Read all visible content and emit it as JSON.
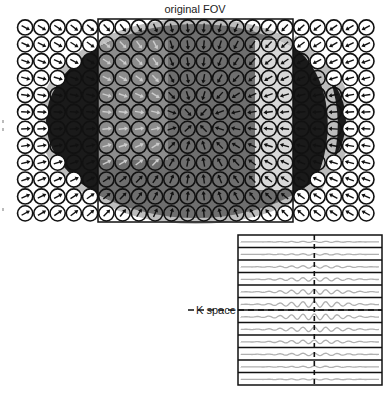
{
  "figure": {
    "title": "original FOV",
    "kspace_label": "K space"
  },
  "grid": {
    "x0": 17,
    "y0": 19,
    "cols": 22,
    "rows": 12,
    "pitch_x": 16.25,
    "pitch_y": 16.9
  },
  "fov_box": {
    "x": 98,
    "y": 19,
    "w": 195,
    "h": 203
  },
  "kspace": {
    "box": {
      "x": 238,
      "y": 235,
      "w": 144,
      "h": 150
    },
    "lines": 12,
    "center_line_color": "#111111",
    "signal_color": "#b0b0b0"
  },
  "colors": {
    "coil_stroke": "#111111",
    "outer_gray": "#bdbdbd",
    "dark": "#1a1a1a",
    "mid": "#6e6e6e",
    "light_panel": "#8c8c8c"
  }
}
